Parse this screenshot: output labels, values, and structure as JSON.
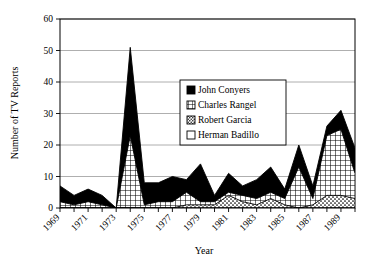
{
  "chart_data": {
    "type": "area",
    "stacked": true,
    "title": "",
    "xlabel": "Year",
    "ylabel": "Number of TV Reports",
    "xlim": [
      1969,
      1990
    ],
    "ylim": [
      0,
      60
    ],
    "yticks": [
      0,
      10,
      20,
      30,
      40,
      50,
      60
    ],
    "xticks": [
      1969,
      1970,
      1971,
      1972,
      1973,
      1974,
      1975,
      1976,
      1977,
      1978,
      1979,
      1980,
      1981,
      1982,
      1983,
      1984,
      1985,
      1986,
      1987,
      1988,
      1989,
      1990
    ],
    "xtick_labels": [
      "1969",
      "",
      "1971",
      "",
      "1973",
      "",
      "1975",
      "",
      "1977",
      "",
      "1979",
      "",
      "1981",
      "",
      "1983",
      "",
      "1985",
      "",
      "1987",
      "",
      "1989",
      ""
    ],
    "grid": true,
    "legend_position": "center",
    "x": [
      1969,
      1970,
      1971,
      1972,
      1973,
      1974,
      1975,
      1976,
      1977,
      1978,
      1979,
      1980,
      1981,
      1982,
      1983,
      1984,
      1985,
      1986,
      1987,
      1988,
      1989,
      1990
    ],
    "series": [
      {
        "name": "Herman Badillo",
        "pattern": "blank",
        "values": [
          0,
          0,
          0,
          0,
          0,
          0,
          0,
          0,
          0,
          0,
          0,
          0,
          0,
          0,
          0,
          0,
          0,
          0,
          0,
          0,
          0,
          0
        ]
      },
      {
        "name": "Robert Garcia",
        "pattern": "stipple",
        "values": [
          0,
          0,
          0,
          0,
          0,
          0,
          0,
          0,
          0,
          1,
          1,
          1,
          4,
          2,
          1,
          3,
          1,
          0,
          1,
          4,
          4,
          3
        ]
      },
      {
        "name": "Charles Rangel",
        "pattern": "grid",
        "values": [
          2,
          1,
          2,
          1,
          0,
          23,
          1,
          2,
          2,
          4,
          1,
          1,
          1,
          2,
          2,
          2,
          2,
          13,
          2,
          19,
          21,
          8
        ]
      },
      {
        "name": "John Conyers",
        "pattern": "solid",
        "values": [
          5,
          3,
          4,
          3,
          0,
          28,
          7,
          6,
          8,
          4,
          12,
          2,
          6,
          3,
          6,
          8,
          3,
          7,
          4,
          3,
          6,
          8
        ]
      }
    ],
    "totals": [
      7,
      4,
      6,
      4,
      0,
      51,
      8,
      8,
      10,
      9,
      14,
      4,
      11,
      7,
      9,
      13,
      6,
      20,
      7,
      26,
      31,
      19
    ]
  },
  "legend": {
    "entries": [
      {
        "label": "John Conyers",
        "swatch": "solid-black-square"
      },
      {
        "label": "Charles Rangel",
        "swatch": "grid-hatch-square"
      },
      {
        "label": "Robert Garcia",
        "swatch": "stipple-square"
      },
      {
        "label": "Herman Badillo",
        "swatch": "white-square"
      }
    ]
  },
  "colors": {
    "ink": "#000000",
    "grid": "#9a9a9a",
    "plot_background": "#ffffff"
  }
}
